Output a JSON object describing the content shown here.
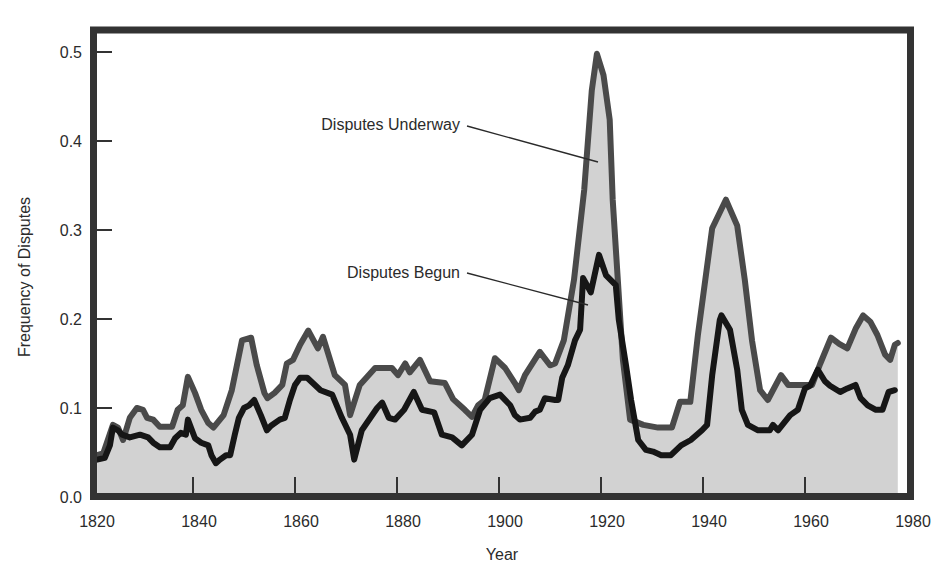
{
  "chart_data": {
    "type": "area",
    "title": "",
    "xlabel": "Year",
    "ylabel": "Frequency of Disputes",
    "xlim": [
      1820,
      1980
    ],
    "ylim": [
      0.0,
      0.5
    ],
    "x_ticks": [
      1820,
      1840,
      1860,
      1880,
      1900,
      1920,
      1940,
      1960,
      1980
    ],
    "x_tick_labels": [
      "1820",
      "1840",
      "1860",
      "1880",
      "1900",
      "1920",
      "1940",
      "1960",
      "1980"
    ],
    "y_ticks": [
      0.0,
      0.1,
      0.2,
      0.3,
      0.4,
      0.5
    ],
    "y_tick_labels": [
      "0.0",
      "0.1",
      "0.2",
      "0.3",
      "0.4",
      "0.5"
    ],
    "grid": false,
    "legend": "none (inline annotations with leader lines)",
    "annotations": [
      {
        "text": "Disputes Underway",
        "series": "Disputes Underway",
        "points_to": [
          1919.5,
          0.38
        ]
      },
      {
        "text": "Disputes Begun",
        "series": "Disputes Begun",
        "points_to": [
          1917.5,
          0.215
        ]
      }
    ],
    "series": [
      {
        "name": "Disputes Underway",
        "color": "#4a4a4a",
        "fill": "#d2d2d2",
        "points": [
          [
            1821.2,
            0.047
          ],
          [
            1822.4,
            0.049
          ],
          [
            1823.3,
            0.064
          ],
          [
            1824.3,
            0.081
          ],
          [
            1825.3,
            0.078
          ],
          [
            1826.3,
            0.064
          ],
          [
            1827.6,
            0.089
          ],
          [
            1829.0,
            0.1
          ],
          [
            1830.2,
            0.098
          ],
          [
            1831.0,
            0.089
          ],
          [
            1832.2,
            0.087
          ],
          [
            1833.5,
            0.079
          ],
          [
            1835.9,
            0.079
          ],
          [
            1837.0,
            0.098
          ],
          [
            1838.0,
            0.103
          ],
          [
            1839.0,
            0.135
          ],
          [
            1840.4,
            0.117
          ],
          [
            1841.6,
            0.098
          ],
          [
            1843.0,
            0.083
          ],
          [
            1844.0,
            0.078
          ],
          [
            1846.0,
            0.092
          ],
          [
            1847.6,
            0.12
          ],
          [
            1848.6,
            0.148
          ],
          [
            1849.6,
            0.176
          ],
          [
            1851.4,
            0.179
          ],
          [
            1852.5,
            0.148
          ],
          [
            1854.0,
            0.117
          ],
          [
            1854.6,
            0.111
          ],
          [
            1856.0,
            0.117
          ],
          [
            1857.5,
            0.126
          ],
          [
            1858.4,
            0.15
          ],
          [
            1859.6,
            0.154
          ],
          [
            1861.0,
            0.171
          ],
          [
            1862.6,
            0.187
          ],
          [
            1864.5,
            0.167
          ],
          [
            1865.5,
            0.18
          ],
          [
            1867.8,
            0.137
          ],
          [
            1869.8,
            0.126
          ],
          [
            1870.8,
            0.092
          ],
          [
            1872.7,
            0.126
          ],
          [
            1875.7,
            0.145
          ],
          [
            1879.0,
            0.145
          ],
          [
            1880.2,
            0.137
          ],
          [
            1881.6,
            0.15
          ],
          [
            1882.5,
            0.14
          ],
          [
            1884.5,
            0.154
          ],
          [
            1886.5,
            0.13
          ],
          [
            1889.4,
            0.128
          ],
          [
            1891.0,
            0.11
          ],
          [
            1893.3,
            0.098
          ],
          [
            1894.7,
            0.09
          ],
          [
            1895.9,
            0.103
          ],
          [
            1897.2,
            0.109
          ],
          [
            1899.2,
            0.156
          ],
          [
            1901.2,
            0.145
          ],
          [
            1903.1,
            0.128
          ],
          [
            1903.9,
            0.12
          ],
          [
            1905.1,
            0.137
          ],
          [
            1908.0,
            0.163
          ],
          [
            1910.0,
            0.148
          ],
          [
            1911.0,
            0.15
          ],
          [
            1912.7,
            0.176
          ],
          [
            1914.7,
            0.244
          ],
          [
            1916.7,
            0.345
          ],
          [
            1918.2,
            0.457
          ],
          [
            1919.2,
            0.498
          ],
          [
            1920.5,
            0.474
          ],
          [
            1921.7,
            0.424
          ],
          [
            1922.3,
            0.334
          ],
          [
            1923.3,
            0.244
          ],
          [
            1924.3,
            0.154
          ],
          [
            1925.7,
            0.087
          ],
          [
            1928.3,
            0.081
          ],
          [
            1931.2,
            0.078
          ],
          [
            1933.9,
            0.078
          ],
          [
            1935.5,
            0.107
          ],
          [
            1937.5,
            0.107
          ],
          [
            1939.0,
            0.182
          ],
          [
            1941.8,
            0.302
          ],
          [
            1944.5,
            0.334
          ],
          [
            1946.7,
            0.305
          ],
          [
            1948.2,
            0.244
          ],
          [
            1949.6,
            0.176
          ],
          [
            1951.2,
            0.12
          ],
          [
            1952.7,
            0.109
          ],
          [
            1955.3,
            0.137
          ],
          [
            1956.7,
            0.126
          ],
          [
            1961.4,
            0.126
          ],
          [
            1963.0,
            0.15
          ],
          [
            1965.1,
            0.179
          ],
          [
            1966.7,
            0.172
          ],
          [
            1968.3,
            0.167
          ],
          [
            1970.0,
            0.19
          ],
          [
            1971.4,
            0.204
          ],
          [
            1972.8,
            0.197
          ],
          [
            1974.2,
            0.182
          ],
          [
            1975.7,
            0.16
          ],
          [
            1976.7,
            0.154
          ],
          [
            1977.6,
            0.171
          ],
          [
            1978.2,
            0.173
          ]
        ]
      },
      {
        "name": "Disputes Begun",
        "color": "#161616",
        "points": [
          [
            1821.2,
            0.042
          ],
          [
            1822.7,
            0.044
          ],
          [
            1823.7,
            0.058
          ],
          [
            1824.3,
            0.078
          ],
          [
            1825.3,
            0.075
          ],
          [
            1826.1,
            0.07
          ],
          [
            1827.6,
            0.067
          ],
          [
            1829.6,
            0.07
          ],
          [
            1831.2,
            0.067
          ],
          [
            1832.2,
            0.061
          ],
          [
            1833.5,
            0.056
          ],
          [
            1835.5,
            0.056
          ],
          [
            1836.5,
            0.066
          ],
          [
            1837.6,
            0.072
          ],
          [
            1838.6,
            0.07
          ],
          [
            1839.0,
            0.087
          ],
          [
            1840.4,
            0.066
          ],
          [
            1841.6,
            0.061
          ],
          [
            1843.0,
            0.058
          ],
          [
            1843.6,
            0.047
          ],
          [
            1844.5,
            0.038
          ],
          [
            1845.3,
            0.042
          ],
          [
            1846.5,
            0.047
          ],
          [
            1847.3,
            0.047
          ],
          [
            1848.2,
            0.07
          ],
          [
            1849.0,
            0.089
          ],
          [
            1850.0,
            0.1
          ],
          [
            1851.0,
            0.103
          ],
          [
            1852.0,
            0.109
          ],
          [
            1853.3,
            0.092
          ],
          [
            1854.5,
            0.075
          ],
          [
            1855.3,
            0.08
          ],
          [
            1857.0,
            0.087
          ],
          [
            1858.0,
            0.089
          ],
          [
            1859.0,
            0.109
          ],
          [
            1860.0,
            0.126
          ],
          [
            1861.0,
            0.134
          ],
          [
            1862.4,
            0.134
          ],
          [
            1865.0,
            0.12
          ],
          [
            1867.3,
            0.115
          ],
          [
            1869.2,
            0.089
          ],
          [
            1870.8,
            0.07
          ],
          [
            1871.6,
            0.042
          ],
          [
            1873.1,
            0.075
          ],
          [
            1876.1,
            0.1
          ],
          [
            1877.1,
            0.106
          ],
          [
            1878.4,
            0.089
          ],
          [
            1879.6,
            0.087
          ],
          [
            1881.4,
            0.098
          ],
          [
            1883.3,
            0.118
          ],
          [
            1884.9,
            0.098
          ],
          [
            1887.3,
            0.095
          ],
          [
            1888.8,
            0.07
          ],
          [
            1890.8,
            0.067
          ],
          [
            1892.7,
            0.058
          ],
          [
            1894.7,
            0.07
          ],
          [
            1896.3,
            0.098
          ],
          [
            1898.2,
            0.111
          ],
          [
            1900.2,
            0.115
          ],
          [
            1902.2,
            0.103
          ],
          [
            1903.1,
            0.092
          ],
          [
            1904.1,
            0.087
          ],
          [
            1906.1,
            0.089
          ],
          [
            1907.1,
            0.096
          ],
          [
            1908.0,
            0.098
          ],
          [
            1909.0,
            0.111
          ],
          [
            1911.0,
            0.109
          ],
          [
            1911.6,
            0.109
          ],
          [
            1912.4,
            0.134
          ],
          [
            1913.5,
            0.148
          ],
          [
            1914.9,
            0.176
          ],
          [
            1915.9,
            0.188
          ],
          [
            1916.5,
            0.246
          ],
          [
            1918.0,
            0.23
          ],
          [
            1919.6,
            0.272
          ],
          [
            1921.0,
            0.249
          ],
          [
            1922.9,
            0.238
          ],
          [
            1923.5,
            0.199
          ],
          [
            1924.9,
            0.148
          ],
          [
            1925.9,
            0.109
          ],
          [
            1927.3,
            0.064
          ],
          [
            1928.8,
            0.053
          ],
          [
            1930.2,
            0.051
          ],
          [
            1931.8,
            0.047
          ],
          [
            1933.7,
            0.047
          ],
          [
            1935.7,
            0.058
          ],
          [
            1937.6,
            0.064
          ],
          [
            1939.8,
            0.075
          ],
          [
            1940.8,
            0.081
          ],
          [
            1941.8,
            0.137
          ],
          [
            1943.3,
            0.199
          ],
          [
            1943.6,
            0.204
          ],
          [
            1945.3,
            0.188
          ],
          [
            1946.7,
            0.143
          ],
          [
            1947.6,
            0.098
          ],
          [
            1948.8,
            0.081
          ],
          [
            1950.8,
            0.075
          ],
          [
            1953.1,
            0.075
          ],
          [
            1953.7,
            0.081
          ],
          [
            1954.7,
            0.075
          ],
          [
            1957.1,
            0.092
          ],
          [
            1958.6,
            0.098
          ],
          [
            1960.0,
            0.122
          ],
          [
            1961.0,
            0.125
          ],
          [
            1962.5,
            0.143
          ],
          [
            1963.9,
            0.13
          ],
          [
            1964.9,
            0.125
          ],
          [
            1966.9,
            0.118
          ],
          [
            1968.3,
            0.122
          ],
          [
            1969.9,
            0.126
          ],
          [
            1970.9,
            0.111
          ],
          [
            1972.3,
            0.103
          ],
          [
            1973.9,
            0.098
          ],
          [
            1975.2,
            0.098
          ],
          [
            1976.4,
            0.118
          ],
          [
            1977.6,
            0.12
          ]
        ]
      }
    ]
  },
  "style": {
    "frame_color": "#333333",
    "fill_color": "#d2d2d2",
    "underway_color": "#4a4a4a",
    "begun_color": "#161616"
  }
}
